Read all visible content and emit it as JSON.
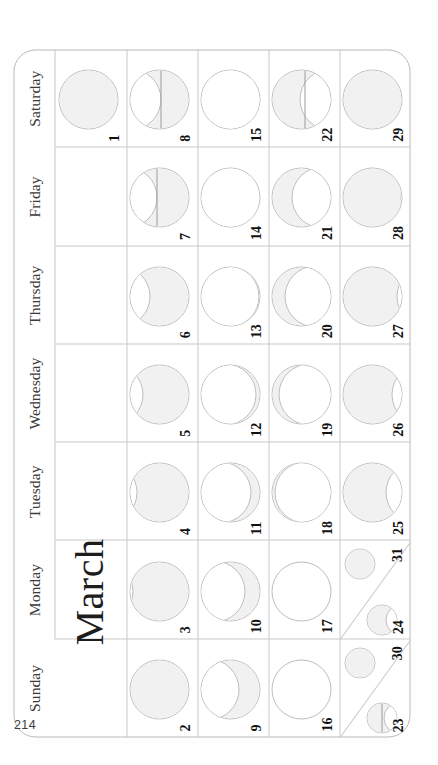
{
  "page": {
    "page_number": "214",
    "month_title": "March"
  },
  "weekdays": [
    {
      "label": "Sunday"
    },
    {
      "label": "Monday"
    },
    {
      "label": "Tuesday"
    },
    {
      "label": "Wednesday"
    },
    {
      "label": "Thursday"
    },
    {
      "label": "Friday"
    },
    {
      "label": "Saturday"
    }
  ],
  "calendar": {
    "weeks": 5,
    "columns": 7,
    "days": [
      {
        "n": "1",
        "col": 6,
        "row": 0,
        "phase": "full",
        "illum": 1.0,
        "waxing": false,
        "size": "large"
      },
      {
        "n": "2",
        "col": 0,
        "row": 1,
        "phase": "full",
        "illum": 0.99,
        "waxing": false,
        "size": "large"
      },
      {
        "n": "3",
        "col": 1,
        "row": 1,
        "phase": "waning-gibbous",
        "illum": 0.96,
        "waxing": false,
        "size": "large"
      },
      {
        "n": "4",
        "col": 2,
        "row": 1,
        "phase": "waning-gibbous",
        "illum": 0.9,
        "waxing": false,
        "size": "large"
      },
      {
        "n": "5",
        "col": 3,
        "row": 1,
        "phase": "waning-gibbous",
        "illum": 0.8,
        "waxing": false,
        "size": "large"
      },
      {
        "n": "6",
        "col": 4,
        "row": 1,
        "phase": "waning-gibbous",
        "illum": 0.68,
        "waxing": false,
        "size": "large"
      },
      {
        "n": "7",
        "col": 5,
        "row": 1,
        "phase": "last-quarter",
        "illum": 0.56,
        "waxing": false,
        "size": "large"
      },
      {
        "n": "8",
        "col": 6,
        "row": 1,
        "phase": "last-quarter",
        "illum": 0.5,
        "waxing": false,
        "size": "large"
      },
      {
        "n": "9",
        "col": 0,
        "row": 2,
        "phase": "waning-crescent",
        "illum": 0.38,
        "waxing": false,
        "size": "large"
      },
      {
        "n": "10",
        "col": 1,
        "row": 2,
        "phase": "waning-crescent",
        "illum": 0.28,
        "waxing": false,
        "size": "large"
      },
      {
        "n": "11",
        "col": 2,
        "row": 2,
        "phase": "waning-crescent",
        "illum": 0.18,
        "waxing": false,
        "size": "large"
      },
      {
        "n": "12",
        "col": 3,
        "row": 2,
        "phase": "waning-crescent",
        "illum": 0.1,
        "waxing": false,
        "size": "large"
      },
      {
        "n": "13",
        "col": 4,
        "row": 2,
        "phase": "waning-crescent",
        "illum": 0.05,
        "waxing": false,
        "size": "large"
      },
      {
        "n": "14",
        "col": 5,
        "row": 2,
        "phase": "waning-crescent",
        "illum": 0.03,
        "waxing": false,
        "size": "large"
      },
      {
        "n": "15",
        "col": 6,
        "row": 2,
        "phase": "new",
        "illum": 0.02,
        "waxing": false,
        "size": "large"
      },
      {
        "n": "16",
        "col": 0,
        "row": 3,
        "phase": "new",
        "illum": 0.0,
        "waxing": true,
        "size": "large"
      },
      {
        "n": "17",
        "col": 1,
        "row": 3,
        "phase": "new",
        "illum": 0.01,
        "waxing": true,
        "size": "large"
      },
      {
        "n": "18",
        "col": 2,
        "row": 3,
        "phase": "waxing-crescent",
        "illum": 0.05,
        "waxing": true,
        "size": "large"
      },
      {
        "n": "19",
        "col": 3,
        "row": 3,
        "phase": "waxing-crescent",
        "illum": 0.12,
        "waxing": true,
        "size": "large"
      },
      {
        "n": "20",
        "col": 4,
        "row": 3,
        "phase": "waxing-crescent",
        "illum": 0.22,
        "waxing": true,
        "size": "large"
      },
      {
        "n": "21",
        "col": 5,
        "row": 3,
        "phase": "waxing-crescent",
        "illum": 0.34,
        "waxing": true,
        "size": "large"
      },
      {
        "n": "22",
        "col": 6,
        "row": 3,
        "phase": "first-quarter",
        "illum": 0.46,
        "waxing": true,
        "size": "large"
      },
      {
        "n": "23",
        "col": 0,
        "row": 4,
        "phase": "first-quarter",
        "illum": 0.55,
        "waxing": true,
        "size": "small"
      },
      {
        "n": "24",
        "col": 1,
        "row": 4,
        "phase": "first-quarter",
        "illum": 0.62,
        "waxing": true,
        "size": "small"
      },
      {
        "n": "25",
        "col": 2,
        "row": 4,
        "phase": "waxing-gibbous",
        "illum": 0.72,
        "waxing": true,
        "size": "large"
      },
      {
        "n": "26",
        "col": 3,
        "row": 4,
        "phase": "waxing-gibbous",
        "illum": 0.82,
        "waxing": true,
        "size": "large"
      },
      {
        "n": "27",
        "col": 4,
        "row": 4,
        "phase": "waxing-gibbous",
        "illum": 0.9,
        "waxing": true,
        "size": "large"
      },
      {
        "n": "28",
        "col": 5,
        "row": 4,
        "phase": "waxing-gibbous",
        "illum": 0.96,
        "waxing": true,
        "size": "large"
      },
      {
        "n": "29",
        "col": 6,
        "row": 4,
        "phase": "full",
        "illum": 0.99,
        "waxing": true,
        "size": "large"
      },
      {
        "n": "30",
        "col": 0,
        "row": 4,
        "phase": "full",
        "illum": 1.0,
        "waxing": true,
        "size": "small",
        "corner": true
      },
      {
        "n": "31",
        "col": 1,
        "row": 4,
        "phase": "full",
        "illum": 1.0,
        "waxing": true,
        "size": "small",
        "corner": true
      }
    ]
  },
  "colors": {
    "grid_line": "#c9c9c9",
    "frame_line": "#b9b9b9",
    "moon_outline": "#bdbdbd",
    "moon_lit": "#f1f1f1",
    "text": "#1a1a1a",
    "weekday_text": "#3a3a3a",
    "page_bg": "#ffffff"
  }
}
